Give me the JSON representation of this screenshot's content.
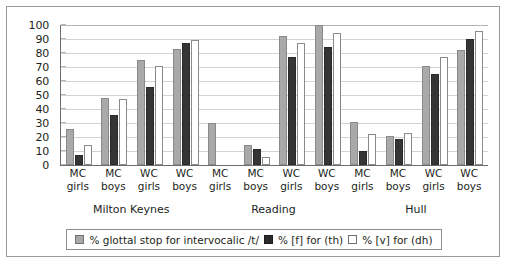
{
  "chart_data": {
    "type": "bar",
    "title": "",
    "xlabel": "",
    "ylabel": "",
    "ylim": [
      0,
      100
    ],
    "ytick_values": [
      0,
      10,
      20,
      30,
      40,
      50,
      60,
      70,
      80,
      90,
      100
    ],
    "grid": true,
    "legend_position": "bottom",
    "cities": [
      "Milton Keynes",
      "Reading",
      "Hull"
    ],
    "categories": [
      "MC girls",
      "MC boys",
      "WC girls",
      "WC boys"
    ],
    "category_lines": [
      [
        "MC",
        "girls"
      ],
      [
        "MC",
        "boys"
      ],
      [
        "WC",
        "girls"
      ],
      [
        "WC",
        "boys"
      ]
    ],
    "series": [
      {
        "name": "% glottal stop for intervocalic /t/",
        "color": "#a9a9a9",
        "values_by_city": {
          "Milton Keynes": [
            26,
            48,
            75,
            83
          ],
          "Reading": [
            30,
            14,
            92,
            100
          ],
          "Hull": [
            31,
            21,
            71,
            82
          ]
        }
      },
      {
        "name": "% [f] for (th)",
        "color": "#353535",
        "values_by_city": {
          "Milton Keynes": [
            7,
            36,
            56,
            87
          ],
          "Reading": [
            null,
            11.5,
            77,
            84
          ],
          "Hull": [
            10,
            18.5,
            65,
            90
          ]
        }
      },
      {
        "name": "% [v] for (dh)",
        "color": "#ffffff",
        "values_by_city": {
          "Milton Keynes": [
            14.5,
            47,
            71,
            89.5
          ],
          "Reading": [
            null,
            6,
            87,
            94
          ],
          "Hull": [
            22,
            23,
            77,
            96
          ]
        }
      }
    ]
  }
}
